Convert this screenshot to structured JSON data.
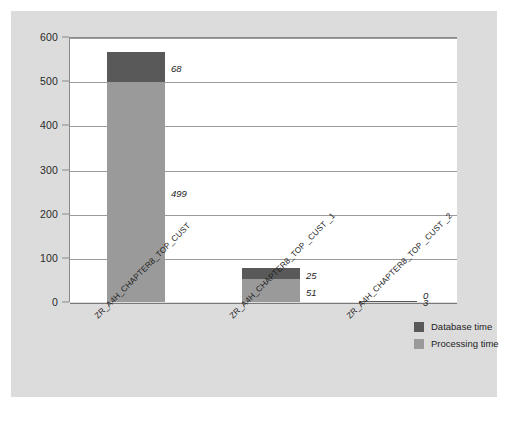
{
  "chart_data": {
    "type": "bar",
    "subtype": "stacked-bar",
    "title": "",
    "xlabel": "",
    "ylabel": "",
    "ylim": [
      0,
      600
    ],
    "ytick_step": 100,
    "yticks": [
      600,
      500,
      400,
      300,
      200,
      100,
      0
    ],
    "ytick_labels": [
      "600",
      "500",
      "400",
      "300",
      "200",
      "100",
      "0"
    ],
    "grid": true,
    "grid_axis": "y",
    "legend_position": "right-bottom",
    "categories": [
      "ZR_A4H_CHAPTER8_TOP_CUST",
      "ZR_A4H_CHAPTER8_TOP _CUST _1",
      "ZR_A4H_CHAPTER8_TOP _CUST _2"
    ],
    "series": [
      {
        "name": "Database time",
        "color": "#595959",
        "values": [
          68,
          25,
          3
        ],
        "value_labels": [
          "68",
          "25",
          "3"
        ]
      },
      {
        "name": "Processing time",
        "color": "#9a9a9a",
        "values": [
          499,
          51,
          0
        ],
        "value_labels": [
          "499",
          "51",
          "0"
        ]
      }
    ],
    "totals": [
      567,
      76,
      3
    ]
  },
  "legend": {
    "items": [
      {
        "label": "Database time",
        "color": "#595959"
      },
      {
        "label": "Processing time",
        "color": "#9a9a9a"
      }
    ]
  },
  "caption": {
    "text": ""
  },
  "colors": {
    "panel_background": "#d5d5d5",
    "plot_background": "#ffffff",
    "gridline": "#9b9b9b",
    "axis": "#8a8a8a",
    "text": "#1d1d1d",
    "database_time": "#595959",
    "processing_time": "#9a9a9a"
  }
}
